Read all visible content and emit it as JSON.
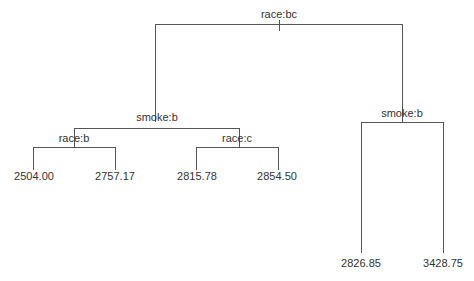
{
  "tree": {
    "root": {
      "label": "race:bc",
      "left": {
        "label": "smoke:b",
        "left": {
          "label": "race:b",
          "leaves": [
            "2504.00",
            "2757.17"
          ]
        },
        "right": {
          "label": "race:c",
          "leaves": [
            "2815.78",
            "2854.50"
          ]
        }
      },
      "right": {
        "label": "smoke:b",
        "leaves": [
          "2826.85",
          "3428.75"
        ]
      }
    }
  },
  "colors": {
    "line": "#555555",
    "text": "#333333",
    "background": "#ffffff"
  }
}
